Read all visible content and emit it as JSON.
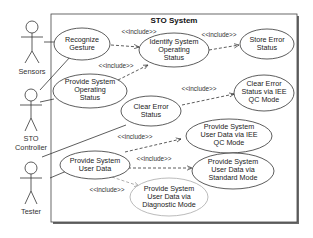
{
  "diagram": {
    "title": "STO System",
    "type": "UML use case diagram",
    "include_label": "<<include>>",
    "actors": [
      {
        "id": "sensors",
        "label_lines": [
          "Sensors"
        ]
      },
      {
        "id": "sto_controller",
        "label_lines": [
          "STO",
          "Controller"
        ]
      },
      {
        "id": "tester",
        "label_lines": [
          "Tester"
        ]
      }
    ],
    "use_cases": [
      {
        "id": "recognize_gesture",
        "lines": [
          "Recognize",
          "Gesture"
        ]
      },
      {
        "id": "identify_status",
        "lines": [
          "Identify System",
          "Operating",
          "Status"
        ]
      },
      {
        "id": "store_error",
        "lines": [
          "Store Error",
          "Status"
        ]
      },
      {
        "id": "provide_operating",
        "lines": [
          "Provide System",
          "Operating",
          "Status"
        ]
      },
      {
        "id": "clear_error_qc",
        "lines": [
          "Clear Error",
          "Status via IEE",
          "QC Mode"
        ]
      },
      {
        "id": "clear_error",
        "lines": [
          "Clear Error",
          "Status"
        ]
      },
      {
        "id": "provide_user_qc",
        "lines": [
          "Provide System",
          "User Data via IEE",
          "QC Mode"
        ]
      },
      {
        "id": "provide_user_data",
        "lines": [
          "Provide System",
          "User Data"
        ]
      },
      {
        "id": "provide_user_standard",
        "lines": [
          "Provide System",
          "User Data via",
          "Standard Mode"
        ]
      },
      {
        "id": "provide_user_diag",
        "lines": [
          "Provide System",
          "User Data via",
          "Diagnostic Mode"
        ]
      }
    ],
    "associations": [
      [
        "sensors",
        "recognize_gesture"
      ],
      [
        "sto_controller",
        "recognize_gesture"
      ],
      [
        "sto_controller",
        "provide_operating"
      ],
      [
        "sto_controller",
        "clear_error"
      ],
      [
        "tester",
        "provide_user_data"
      ]
    ],
    "includes": [
      [
        "recognize_gesture",
        "identify_status"
      ],
      [
        "provide_operating",
        "identify_status"
      ],
      [
        "identify_status",
        "store_error"
      ],
      [
        "clear_error",
        "clear_error_qc"
      ],
      [
        "provide_user_data",
        "provide_user_qc"
      ],
      [
        "provide_user_data",
        "provide_user_standard"
      ],
      [
        "provide_user_data",
        "provide_user_diag"
      ]
    ],
    "colors": {
      "line": "#333333",
      "frame_shadow": "#555555",
      "diag_line": "#9a9a9a"
    }
  }
}
